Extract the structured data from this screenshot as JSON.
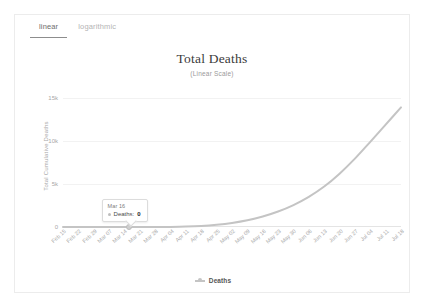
{
  "tabs": [
    {
      "label": "linear",
      "active": true
    },
    {
      "label": "logarithmic",
      "active": false
    }
  ],
  "legend": {
    "label": "Deaths"
  },
  "tooltip": {
    "date": "Mar 16",
    "series_label": "Deaths:",
    "value": "0"
  },
  "colors": {
    "series_line": "#c4c4c4",
    "gridline": "#f2f2f2",
    "axis": "#e4e4e4",
    "tick_text": "#a8a8a8",
    "title_text": "#3b3b3b",
    "tab_active": "#6d6d6d",
    "tab_inactive": "#b4b4b4",
    "card_border": "#ececec"
  },
  "chart_data": {
    "type": "line",
    "title": "Total Deaths",
    "subtitle": "(Linear Scale)",
    "xlabel": "",
    "ylabel": "Total Cumulative Deaths",
    "ylim": [
      0,
      16500
    ],
    "yticks": [
      0,
      5000,
      10000,
      15000
    ],
    "ytick_labels": [
      "0",
      "5k",
      "10k",
      "15k"
    ],
    "grid": true,
    "legend_position": "bottom",
    "categories": [
      "Feb 15",
      "Feb 22",
      "Feb 29",
      "Mar 07",
      "Mar 14",
      "Mar 21",
      "Mar 28",
      "Apr 04",
      "Apr 11",
      "Apr 18",
      "Apr 25",
      "May 02",
      "May 09",
      "May 16",
      "May 23",
      "May 30",
      "Jun 06",
      "Jun 13",
      "Jun 20",
      "Jun 27",
      "Jul 04",
      "Jul 11",
      "Jul 18"
    ],
    "series": [
      {
        "name": "Deaths",
        "values": [
          0,
          0,
          0,
          0,
          0,
          0,
          2,
          12,
          45,
          120,
          260,
          470,
          780,
          1220,
          1800,
          2550,
          3500,
          4700,
          6200,
          7950,
          9900,
          11900,
          13900
        ]
      }
    ],
    "annotations": [
      {
        "x": "Mar 16",
        "label": "Deaths:",
        "value": "0"
      }
    ]
  }
}
